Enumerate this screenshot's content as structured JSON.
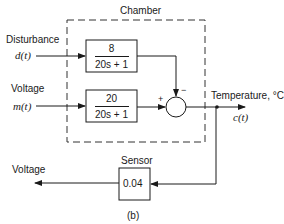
{
  "figure_label": "(b)",
  "chamber": {
    "label": "Chamber"
  },
  "inputs": {
    "disturbance": {
      "label": "Disturbance",
      "signal": "d(t)"
    },
    "voltage": {
      "label": "Voltage",
      "signal": "m(t)"
    }
  },
  "blocks": {
    "disturbance_tf": {
      "numerator": "8",
      "denominator": "20s + 1"
    },
    "voltage_tf": {
      "numerator": "20",
      "denominator": "20s + 1"
    },
    "sensor": {
      "label": "Sensor",
      "gain": "0.04"
    }
  },
  "summing_junction": {
    "plus_sign": "+",
    "minus_sign": "−"
  },
  "output": {
    "label": "Temperature, °C",
    "signal": "c(t)"
  },
  "feedback_output": {
    "label": "Voltage"
  },
  "colors": {
    "line": "#1a1a1a",
    "background": "#ffffff"
  }
}
